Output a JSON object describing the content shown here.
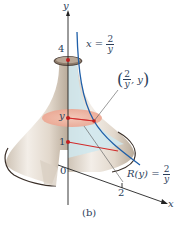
{
  "figure": {
    "caption": "(b)",
    "axes": {
      "y_label": "y",
      "x_label": "x",
      "origin_label": "0",
      "y_ticks": [
        "4",
        "1"
      ],
      "x_ticks": [
        "2"
      ],
      "y_variable_label": "y"
    },
    "curve_label": {
      "lhs": "x =",
      "num": "2",
      "den": "y"
    },
    "point_label": {
      "num": "2",
      "den": "y",
      "suffix": ", y"
    },
    "radius_label": {
      "lhs": "R(y) =",
      "num": "2",
      "den": "y"
    },
    "colors": {
      "solid_surface": "#e6ddd2",
      "solid_shadow": "#b8ab9b",
      "region_fill": "#cfe7ef",
      "disk_fill": "#f3b8a6",
      "curve": "#1f5fa8",
      "radius_line": "#d12a2a",
      "axes": "#222222",
      "text": "#2c3e5a"
    }
  }
}
